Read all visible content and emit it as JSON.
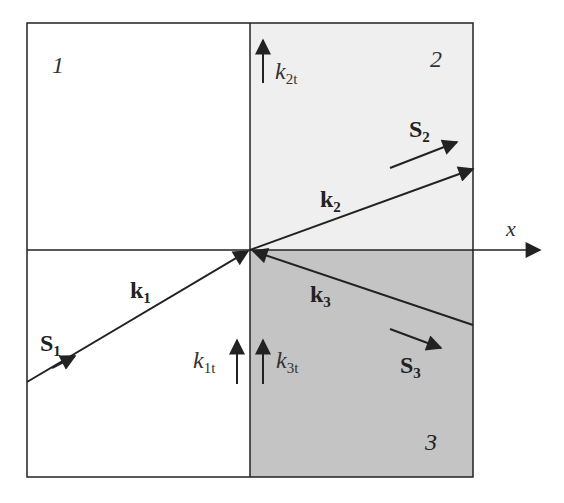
{
  "diagram": {
    "colors": {
      "region1_fill": "#ffffff",
      "region2_fill": "#efefef",
      "region3_fill": "#c4c4c4",
      "stroke": "#222222"
    },
    "regions": [
      {
        "id": "1",
        "label": "1"
      },
      {
        "id": "2",
        "label": "2"
      },
      {
        "id": "3",
        "label": "3"
      }
    ],
    "axis": {
      "label": "x"
    },
    "vectors": {
      "k1": {
        "label": "k",
        "sub": "1"
      },
      "k2": {
        "label": "k",
        "sub": "2"
      },
      "k3": {
        "label": "k",
        "sub": "3"
      },
      "S1": {
        "label": "S",
        "sub": "1"
      },
      "S2": {
        "label": "S",
        "sub": "2"
      },
      "S3": {
        "label": "S",
        "sub": "3"
      }
    },
    "tangential": {
      "k1t": {
        "label": "k",
        "sub": "1t"
      },
      "k2t": {
        "label": "k",
        "sub": "2t"
      },
      "k3t": {
        "label": "k",
        "sub": "3t"
      }
    }
  }
}
